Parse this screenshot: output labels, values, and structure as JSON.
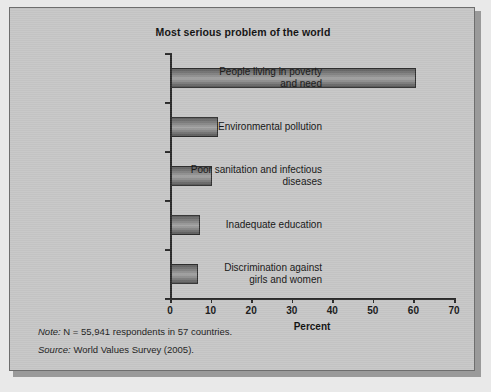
{
  "figure": {
    "title": "Most serious problem of the world",
    "note_label": "Note:",
    "note_text": " N = 55,941 respondents in 57 countries.",
    "source_label": "Source:",
    "source_text": " World Values Survey (2005)."
  },
  "chart_data": {
    "type": "bar",
    "orientation": "horizontal",
    "title": "Most serious problem of the world",
    "xlabel": "Percent",
    "ylabel": "",
    "categories": [
      "People living in poverty and need",
      "Environmental pollution",
      "Poor sanitation and infectious diseases",
      "Inadequate education",
      "Discrimination against girls and women"
    ],
    "category_lines": [
      [
        "People living in poverty",
        "and need"
      ],
      [
        "Environmental pollution"
      ],
      [
        "Poor sanitation and infectious",
        "diseases"
      ],
      [
        "Inadequate education"
      ],
      [
        "Discrimination against",
        "girls and women"
      ]
    ],
    "values": [
      60.5,
      11.5,
      10.0,
      7.2,
      6.6
    ],
    "xlim": [
      0,
      70
    ],
    "xticks": [
      0,
      10,
      20,
      30,
      40,
      50,
      60,
      70
    ],
    "xtick_labels": [
      "0",
      "10",
      "20",
      "30",
      "40",
      "50",
      "60",
      "70"
    ],
    "grid": false,
    "legend": null,
    "bar_color": "#8a8a8a",
    "bar_edge_color": "#2e2e2e"
  },
  "colors": {
    "panel_background": "#c6c6c6",
    "page_background": "#e9e9e9",
    "axis": "#2a2a2a",
    "text": "#141414"
  }
}
